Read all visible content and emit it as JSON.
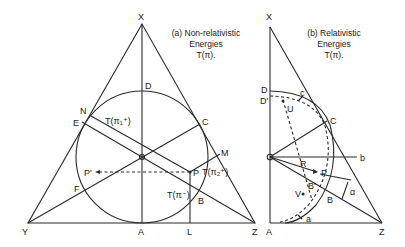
{
  "panel_a": {
    "caption_line1": "(a) Non-relativistic",
    "caption_line2": "Energies",
    "caption_line3": "T(π).",
    "labels": {
      "X": "X",
      "Y": "Y",
      "Z": "Z",
      "A": "A",
      "D": "D",
      "N": "N",
      "E": "E",
      "C": "C",
      "M": "M",
      "F": "F",
      "P": "P",
      "P_prime": "P'",
      "L": "L",
      "B": "B",
      "T_pi1": "T(π₁⁺)",
      "T_pi2": "T(π₂⁺)",
      "T_pim": "T(π⁻)"
    }
  },
  "panel_b": {
    "caption_line1": "(b) Relativistic",
    "caption_line2": "Energies",
    "caption_line3": "T(π).",
    "labels": {
      "X": "X",
      "D": "D",
      "D_prime": "D'",
      "c": "c",
      "U": "U",
      "C": "C",
      "R": "R",
      "b": "b",
      "P": "P",
      "B_prime": "B'",
      "V": "V",
      "B": "B",
      "alpha": "α",
      "a": "a",
      "A": "A",
      "Z": "Z"
    }
  },
  "colors": {
    "ink": "#2a2a2a",
    "background": "#ffffff"
  }
}
